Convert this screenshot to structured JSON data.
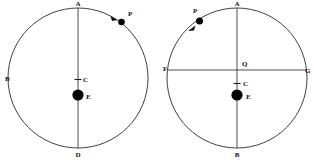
{
  "figure": {
    "type": "astronomy-orbit-diagram",
    "background_color": "#ffffff",
    "stroke_color": "#2b2b2b",
    "body_color": "#000000",
    "width": 314,
    "height": 160,
    "panels": [
      {
        "id": "left-panel",
        "name": "orbit-diagram-left",
        "center": {
          "x": 78,
          "y": 78
        },
        "radius": 70,
        "circle_label": "orbit-circle-left",
        "labels": [
          {
            "key": "A",
            "text": "A",
            "name": "point-label-a-left",
            "x": 78,
            "y": 6,
            "anchor": "middle"
          },
          {
            "key": "B",
            "text": "B",
            "name": "point-label-b-left",
            "x": 5,
            "y": 81,
            "anchor": "start"
          },
          {
            "key": "C",
            "text": "C",
            "name": "point-label-c-left",
            "x": 83,
            "y": 82,
            "anchor": "start"
          },
          {
            "key": "E",
            "text": "E",
            "name": "point-label-e-left",
            "x": 86,
            "y": 99,
            "anchor": "start"
          },
          {
            "key": "D",
            "text": "D",
            "name": "point-label-d-left",
            "x": 78,
            "y": 157,
            "anchor": "middle"
          },
          {
            "key": "P",
            "text": "P",
            "name": "point-label-p-left",
            "x": 128,
            "y": 16,
            "anchor": "start"
          }
        ],
        "axes": [
          {
            "name": "vertical-diameter-left",
            "x1": 78,
            "y1": 8,
            "x2": 78,
            "y2": 148
          }
        ],
        "ticks": [
          {
            "name": "center-tick-c-left",
            "x1": 74.5,
            "y1": 79.5,
            "x2": 81.5,
            "y2": 79.5
          }
        ],
        "bodies": [
          {
            "name": "earth-body-left",
            "x": 78,
            "y": 95,
            "r": 5.6
          },
          {
            "name": "planet-p-left",
            "x": 121.5,
            "y": 22,
            "r": 3.3
          }
        ],
        "arrow": {
          "name": "motion-arrow-left",
          "direction": "clockwise",
          "points": "110.5,16.0 117.5,20.0 112.0,21.0"
        }
      },
      {
        "id": "right-panel",
        "name": "orbit-diagram-right",
        "center": {
          "x": 237,
          "y": 78
        },
        "radius": 70,
        "circle_label": "orbit-circle-right",
        "labels": [
          {
            "key": "A",
            "text": "A",
            "name": "point-label-a-right",
            "x": 237,
            "y": 6,
            "anchor": "middle"
          },
          {
            "key": "F",
            "text": "F",
            "name": "point-label-f-right",
            "x": 163,
            "y": 71,
            "anchor": "start"
          },
          {
            "key": "G",
            "text": "G",
            "name": "point-label-g-right",
            "x": 305,
            "y": 73,
            "anchor": "start"
          },
          {
            "key": "Q",
            "text": "Q",
            "name": "point-label-q-right",
            "x": 242,
            "y": 66,
            "anchor": "start"
          },
          {
            "key": "C",
            "text": "C",
            "name": "point-label-c-right",
            "x": 243,
            "y": 86,
            "anchor": "start"
          },
          {
            "key": "E",
            "text": "E",
            "name": "point-label-e-right",
            "x": 246,
            "y": 99,
            "anchor": "start"
          },
          {
            "key": "B",
            "text": "B",
            "name": "point-label-b-right",
            "x": 237,
            "y": 157,
            "anchor": "middle"
          },
          {
            "key": "P",
            "text": "P",
            "name": "point-label-p-right",
            "x": 193,
            "y": 13,
            "anchor": "start"
          }
        ],
        "axes": [
          {
            "name": "vertical-diameter-right",
            "x1": 237,
            "y1": 8,
            "x2": 237,
            "y2": 148
          },
          {
            "name": "horizontal-diameter-right",
            "x1": 168,
            "y1": 70,
            "x2": 307,
            "y2": 70
          }
        ],
        "ticks": [
          {
            "name": "center-tick-c-right",
            "x1": 233.5,
            "y1": 83.5,
            "x2": 240.5,
            "y2": 83.5
          }
        ],
        "bodies": [
          {
            "name": "earth-body-right",
            "x": 237,
            "y": 95,
            "r": 5.6
          },
          {
            "name": "planet-p-right",
            "x": 199.5,
            "y": 21,
            "r": 3.5
          }
        ],
        "arrow": {
          "name": "motion-arrow-right",
          "direction": "counterclockwise",
          "points": "188.0,31.0 195.5,25.5 194.0,30.5"
        }
      }
    ]
  }
}
